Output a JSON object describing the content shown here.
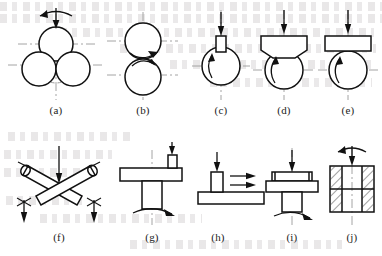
{
  "figure": {
    "row_count": 2,
    "panel_count": 10,
    "background_note": "faint show-through text from reverse page",
    "line_color": "#111111",
    "centerline_color": "#9a9a9a",
    "page_background": "#ffffff"
  },
  "panels": [
    {
      "id": "a",
      "caption": "(a)",
      "name": "four-ball-configuration",
      "description": "Four-ball: one upper ball loaded against three lower balls",
      "elements": [
        "upper-ball",
        "lower-ball-left",
        "lower-ball-right",
        "hidden-rear-ball",
        "vertical-load-arrow",
        "rotation-arc-arrow",
        "horizontal-centerline",
        "vertical-centerline"
      ],
      "load_arrow": "down",
      "rotation": "clockwise-top"
    },
    {
      "id": "b",
      "caption": "(b)",
      "name": "ball-on-ball-configuration",
      "description": "Ball-on-ball: two equal balls in point contact, counter-rotating",
      "elements": [
        "upper-ball",
        "lower-ball",
        "upper-rotation-arrow",
        "lower-rotation-arrow",
        "horizontal-centerline",
        "vertical-centerline"
      ],
      "load_arrow": "none",
      "rotation": "contact-point-arrows"
    },
    {
      "id": "c",
      "caption": "(c)",
      "name": "pin-on-ball-configuration",
      "description": "Narrow pin loaded vertically onto a rotating ball",
      "elements": [
        "pin",
        "ball",
        "vertical-load-arrow",
        "internal-rotation-arc",
        "horizontal-centerline",
        "vertical-centerline"
      ],
      "load_arrow": "down",
      "rotation": "counter-clockwise"
    },
    {
      "id": "d",
      "caption": "(d)",
      "name": "vee-block-on-ball-configuration",
      "description": "V-grooved block pressed onto a rotating ball",
      "elements": [
        "vee-block",
        "ball",
        "vertical-load-arrow",
        "internal-rotation-arc",
        "horizontal-centerline",
        "vertical-centerline"
      ],
      "load_arrow": "down",
      "rotation": "counter-clockwise"
    },
    {
      "id": "e",
      "caption": "(e)",
      "name": "flat-on-ball-configuration",
      "description": "Flat plate pressed onto a rotating ball",
      "elements": [
        "flat-block",
        "ball",
        "vertical-load-arrow",
        "internal-rotation-arc",
        "horizontal-centerline",
        "vertical-centerline"
      ],
      "load_arrow": "down",
      "rotation": "counter-clockwise"
    },
    {
      "id": "f",
      "caption": "(f)",
      "name": "crossed-cylinders-configuration",
      "description": "Two cylinders crossed at right angles, loaded at the crossing point",
      "elements": [
        "cylinder-upper-left",
        "cylinder-upper-right",
        "center-load-arrow",
        "left-load-arrow",
        "right-load-arrow",
        "left-rotation-mark",
        "right-rotation-mark"
      ],
      "load_arrow": "down",
      "rotation": "cylinder-ends"
    },
    {
      "id": "g",
      "caption": "(g)",
      "name": "pin-on-rotating-disc-configuration",
      "description": "Pin loaded vertically onto the face of a rotating disc on a shaft",
      "elements": [
        "pin",
        "disc",
        "shaft",
        "vertical-load-arrow",
        "shaft-rotation-arrow",
        "vertical-centerline"
      ],
      "load_arrow": "down",
      "rotation": "shaft-axis"
    },
    {
      "id": "h",
      "caption": "(h)",
      "name": "pin-on-reciprocating-flat-configuration",
      "description": "Pin loaded onto a flat plate moving in reciprocating sliding",
      "elements": [
        "pin",
        "flat-plate",
        "vertical-load-arrow",
        "reciprocating-arrow-upper",
        "reciprocating-arrow-lower"
      ],
      "load_arrow": "down",
      "rotation": "reciprocating-sliding"
    },
    {
      "id": "i",
      "caption": "(i)",
      "name": "thrust-washer-configuration",
      "description": "Annular thrust washer loaded axially against a rotating shaft collar",
      "elements": [
        "upper-washer",
        "lower-collar",
        "shaft",
        "vertical-load-arrow",
        "shaft-rotation-arrow",
        "vertical-centerline"
      ],
      "load_arrow": "down",
      "rotation": "shaft-axis"
    },
    {
      "id": "j",
      "caption": "(j)",
      "name": "block-in-bore-configuration",
      "description": "Sectioned block with hatched walls, shaft loaded and rotating inside the bore",
      "elements": [
        "hatched-section-left",
        "hatched-section-right",
        "bore",
        "vertical-load-arrow",
        "rotation-arc-arrow",
        "vertical-centerline"
      ],
      "load_arrow": "down",
      "rotation": "clockwise-top"
    }
  ]
}
